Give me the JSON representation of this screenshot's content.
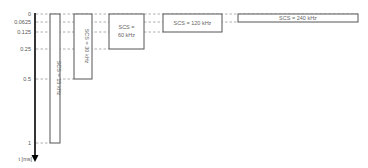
{
  "axis": {
    "label": "t [ms]",
    "ticks": [
      {
        "label": "0",
        "y": 14
      },
      {
        "label": "0.0625",
        "y": 22
      },
      {
        "label": "0.125",
        "y": 32
      },
      {
        "label": "0.25",
        "y": 49
      },
      {
        "label": "0.5",
        "y": 79
      },
      {
        "label": "1",
        "y": 143
      }
    ]
  },
  "slots": [
    {
      "label": "SCS = 15 kHz",
      "duration_ms": 1,
      "orientation": "vertical"
    },
    {
      "label": "SCS = 30 kHz",
      "duration_ms": 0.5,
      "orientation": "vertical"
    },
    {
      "label_line1": "SCS =",
      "label_line2": "60 kHz",
      "duration_ms": 0.25,
      "orientation": "horizontal"
    },
    {
      "label": "SCS = 120 kHz",
      "duration_ms": 0.125,
      "orientation": "horizontal"
    },
    {
      "label": "SCS = 240 kHz",
      "duration_ms": 0.0625,
      "orientation": "horizontal"
    }
  ],
  "colors": {
    "axis": "#000000",
    "box": "#555555",
    "dash": "#999999",
    "text": "#666666"
  }
}
